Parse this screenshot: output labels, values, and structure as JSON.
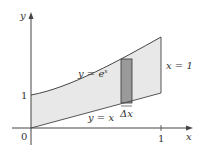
{
  "diagram": {
    "axes": {
      "x_label": "x",
      "y_label": "y",
      "origin_label": "0",
      "x_tick_label": "1",
      "y_tick_label": "1"
    },
    "curves": [
      {
        "name": "upper",
        "label_lhs": "y = e",
        "label_exp": "x"
      },
      {
        "name": "lower",
        "label": "y = x"
      }
    ],
    "boundary_label": "x = 1",
    "strip_label": "Δx",
    "colors": {
      "region_fill": "#e8e8e8",
      "strip_fill": "#9a9a9a",
      "line": "#444444"
    }
  }
}
